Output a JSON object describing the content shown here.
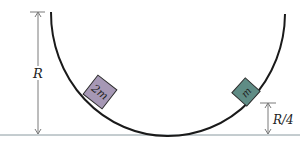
{
  "diagram": {
    "track": {
      "shape": "semicircle",
      "color": "#1a1a1a"
    },
    "ground_line_color": "#8a9aa0",
    "dimension_color": "#7a7a7a",
    "labels": {
      "radius": "R",
      "height_small": "R/4"
    },
    "blocks": [
      {
        "label": "2m",
        "fill": "#a698b5",
        "side": "left"
      },
      {
        "label": "m",
        "fill": "#5f8c85",
        "side": "right"
      }
    ]
  }
}
